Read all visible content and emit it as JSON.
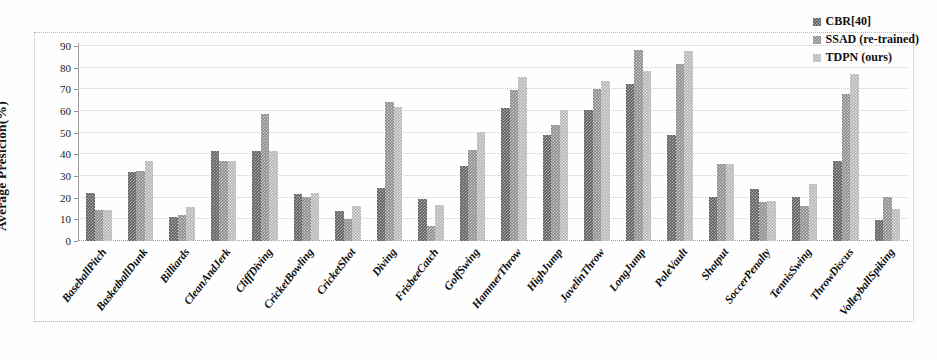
{
  "chart_data": {
    "type": "bar",
    "title": "",
    "xlabel": "",
    "ylabel": "Average Presicion(%)",
    "ylim": [
      0,
      90
    ],
    "yticks": [
      0,
      10,
      20,
      30,
      40,
      50,
      60,
      70,
      80,
      90
    ],
    "grid": true,
    "legend_position": "top-right",
    "categories": [
      "BaseballPitch",
      "BasketballDunk",
      "Billiards",
      "CleanAndJerk",
      "CliffDiving",
      "CricketBowling",
      "CricketShot",
      "Diving",
      "FrisbeeCatch",
      "GolfSwing",
      "HammerThrow",
      "HighJump",
      "JavelinThrow",
      "LongJump",
      "PoleVault",
      "Shotput",
      "SoccerPenalty",
      "TennisSwing",
      "ThrowDiscus",
      "VolleyballSpiking"
    ],
    "series": [
      {
        "name": "CBR[40]",
        "color": "#5d5d5d",
        "values": [
          22,
          32,
          11,
          41.5,
          41.5,
          21.5,
          14,
          24.5,
          19.5,
          34.5,
          61.5,
          49,
          60.5,
          72.5,
          49,
          20.5,
          24,
          20.5,
          37,
          9.5
        ]
      },
      {
        "name": "SSAD (re-trained)",
        "color": "#8a8a8a",
        "values": [
          14.5,
          32.5,
          12,
          37,
          58.5,
          20.5,
          10,
          64,
          7,
          42,
          69.5,
          53.5,
          70,
          88,
          81.5,
          35.5,
          18,
          16,
          68,
          20.5
        ]
      },
      {
        "name": "TDPN (ours)",
        "color": "#b4b4b4",
        "values": [
          14.5,
          37,
          15.5,
          37,
          41.5,
          22,
          16,
          62,
          16.5,
          50.5,
          75.5,
          60.5,
          74,
          78.5,
          87.5,
          35.5,
          18.5,
          26.5,
          77,
          15
        ]
      }
    ]
  },
  "legend": {
    "entries": [
      {
        "label": "CBR[40]"
      },
      {
        "label": "SSAD (re-trained)"
      },
      {
        "label": "TDPN (ours)"
      }
    ]
  },
  "axis": {
    "y_title": "Average Presicion(%)"
  }
}
